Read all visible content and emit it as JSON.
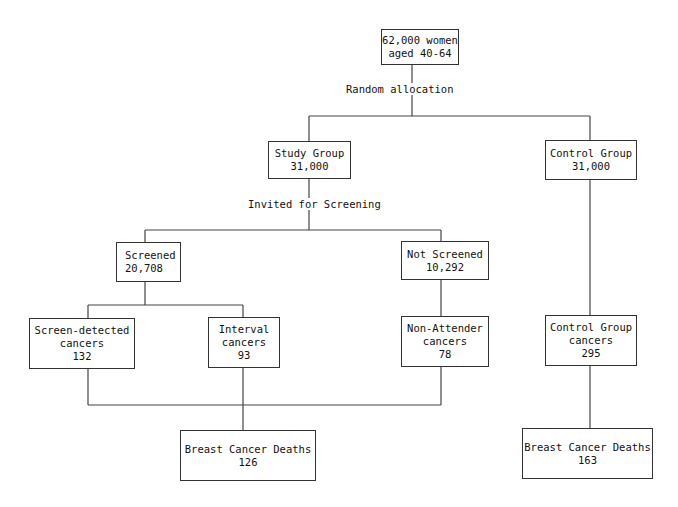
{
  "diagram": {
    "type": "flowchart",
    "nodes": {
      "population": {
        "line1": "62,000 women",
        "line2": "aged 40-64"
      },
      "study_group": {
        "line1": "Study Group",
        "line2": "31,000"
      },
      "control_group": {
        "line1": "Control Group",
        "line2": "31,000"
      },
      "screened": {
        "line1": "Screened",
        "line2": "20,708"
      },
      "not_screened": {
        "line1": "Not Screened",
        "line2": "10,292"
      },
      "screen_detected": {
        "line1": "Screen-detected",
        "line2": "cancers",
        "line3": "132"
      },
      "interval": {
        "line1": "Interval",
        "line2": "cancers",
        "line3": "93"
      },
      "non_attender": {
        "line1": "Non-Attender",
        "line2": "cancers",
        "line3": "78"
      },
      "control_cancers": {
        "line1": "Control Group",
        "line2": "cancers",
        "line3": "295"
      },
      "study_deaths": {
        "line1": "Breast Cancer Deaths",
        "line2": "126"
      },
      "control_deaths": {
        "line1": "Breast Cancer Deaths",
        "line2": "163"
      }
    },
    "edge_labels": {
      "random_allocation": "Random allocation",
      "invited": "Invited for Screening"
    },
    "edges": [
      [
        "population",
        "study_group"
      ],
      [
        "population",
        "control_group"
      ],
      [
        "study_group",
        "screened"
      ],
      [
        "study_group",
        "not_screened"
      ],
      [
        "screened",
        "screen_detected"
      ],
      [
        "screened",
        "interval"
      ],
      [
        "not_screened",
        "non_attender"
      ],
      [
        "control_group",
        "control_cancers"
      ],
      [
        "screen_detected",
        "study_deaths"
      ],
      [
        "interval",
        "study_deaths"
      ],
      [
        "non_attender",
        "study_deaths"
      ],
      [
        "control_cancers",
        "control_deaths"
      ]
    ]
  }
}
